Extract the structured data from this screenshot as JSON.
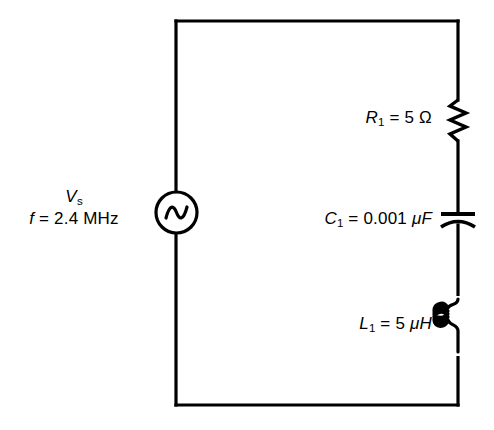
{
  "figure": {
    "type": "schematic",
    "background_color": "#ffffff",
    "line_color": "#000000"
  },
  "source": {
    "name": "ac-voltage-source",
    "symbol": "ac-source-icon",
    "label_line1_var": "V",
    "label_line1_sub": "s",
    "label_line2_var": "f",
    "label_line2_rest": " = 2.4 MHz",
    "frequency_value": "2.4",
    "frequency_unit": "MHz"
  },
  "components": [
    {
      "name": "resistor",
      "symbol": "resistor-zigzag-icon",
      "designator_var": "R",
      "designator_sub": "1",
      "equals_value": " = 5 ",
      "unit": "Ω",
      "value": "5",
      "unit_name": "ohm"
    },
    {
      "name": "capacitor",
      "symbol": "capacitor-curved-plate-icon",
      "designator_var": "C",
      "designator_sub": "1",
      "equals_value": " = 0.001 ",
      "unit": "μF",
      "value": "0.001",
      "unit_name": "microfarad"
    },
    {
      "name": "inductor",
      "symbol": "inductor-coil-icon",
      "designator_var": "L",
      "designator_sub": "1",
      "equals_value": " = 5 ",
      "unit": "μH",
      "value": "5",
      "unit_name": "microhenry"
    }
  ]
}
